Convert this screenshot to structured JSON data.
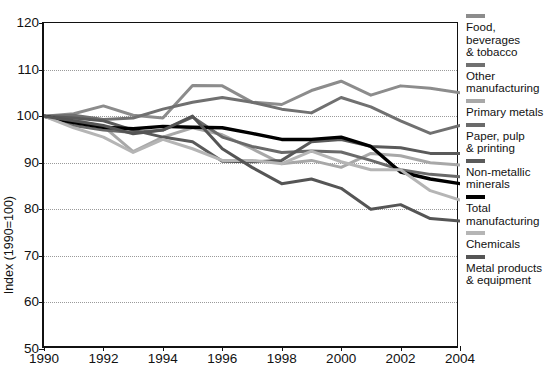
{
  "chart_data": {
    "type": "line",
    "title": "",
    "xlabel": "",
    "ylabel": "Index (1990=100)",
    "xlim": [
      1990,
      2004
    ],
    "ylim": [
      50,
      120
    ],
    "yticks": [
      50,
      60,
      70,
      80,
      90,
      100,
      110,
      120
    ],
    "xticks": [
      1990,
      1992,
      1994,
      1996,
      1998,
      2000,
      2002,
      2004
    ],
    "gridlines": [
      60,
      70,
      80,
      90,
      100,
      110
    ],
    "grid": "horizontal-dotted",
    "legend_position": "right",
    "x": [
      1990,
      1991,
      1992,
      1993,
      1994,
      1995,
      1996,
      1997,
      1998,
      1999,
      2000,
      2001,
      2002,
      2003,
      2004
    ],
    "series": [
      {
        "name": "Food, beverages & tobacco",
        "color": "#8c8c8c",
        "values": [
          100,
          100.5,
          102.2,
          100.2,
          99.6,
          106.6,
          106.5,
          103.0,
          102.5,
          105.5,
          107.5,
          104.5,
          106.5,
          106.0,
          105.0
        ]
      },
      {
        "name": "Other manufacturing",
        "color": "#707070",
        "values": [
          100,
          100.2,
          99.3,
          99.6,
          101.5,
          103.0,
          104.0,
          103.0,
          101.5,
          100.7,
          104.0,
          102.0,
          99.0,
          96.3,
          98.0
        ]
      },
      {
        "name": "Primary metals",
        "color": "#a8a8a8",
        "values": [
          100,
          99.2,
          97.8,
          92.4,
          95.5,
          97.5,
          96.0,
          93.0,
          89.8,
          90.5,
          89.0,
          92.0,
          91.5,
          90.0,
          89.5
        ]
      },
      {
        "name": "Paper, pulp & printing",
        "color": "#6a6a6a",
        "values": [
          100,
          98.0,
          97.0,
          96.5,
          97.0,
          99.8,
          95.5,
          93.5,
          92.2,
          92.5,
          92.3,
          90.5,
          88.5,
          87.5,
          87.0
        ]
      },
      {
        "name": "Non-metallic minerals",
        "color": "#5a5a5a",
        "values": [
          100,
          99.6,
          99.0,
          97.0,
          95.5,
          94.5,
          90.3,
          90.2,
          90.5,
          94.5,
          95.0,
          93.5,
          93.2,
          92.0,
          92.0
        ]
      },
      {
        "name": "Total manufacturing",
        "color": "#000000",
        "values": [
          100,
          98.6,
          97.6,
          97.3,
          97.8,
          97.6,
          97.5,
          96.3,
          95.0,
          95.0,
          95.5,
          93.5,
          88.0,
          86.5,
          85.5
        ]
      },
      {
        "name": "Chemicals",
        "color": "#b5b5b5",
        "values": [
          100,
          97.5,
          95.5,
          92.2,
          95.0,
          93.0,
          90.5,
          90.5,
          89.8,
          92.5,
          90.2,
          88.5,
          88.5,
          84.0,
          82.0
        ]
      },
      {
        "name": "Metal products & equipment",
        "color": "#555555",
        "values": [
          100,
          99.0,
          98.0,
          96.2,
          97.0,
          100.0,
          93.0,
          89.0,
          85.5,
          86.5,
          84.5,
          80.0,
          81.0,
          78.0,
          77.5
        ]
      }
    ]
  },
  "legend": {
    "items": [
      {
        "label": "Food, beverages\n& tobacco",
        "color": "#8c8c8c"
      },
      {
        "label": "Other\nmanufacturing",
        "color": "#707070"
      },
      {
        "label": "Primary metals",
        "color": "#a8a8a8"
      },
      {
        "label": "Paper, pulp\n& printing",
        "color": "#6a6a6a"
      },
      {
        "label": "Non-metallic\nminerals",
        "color": "#5a5a5a"
      },
      {
        "label": "Total\nmanufacturing",
        "color": "#000000"
      },
      {
        "label": "Chemicals",
        "color": "#b5b5b5"
      },
      {
        "label": "Metal products\n& equipment",
        "color": "#555555"
      }
    ]
  },
  "axes": {
    "y_label": "Index (1990=100)",
    "y_ticks": [
      "50",
      "60",
      "70",
      "80",
      "90",
      "100",
      "110",
      "120"
    ],
    "x_ticks": [
      "1990",
      "1992",
      "1994",
      "1996",
      "1998",
      "2000",
      "2002",
      "2004"
    ]
  }
}
